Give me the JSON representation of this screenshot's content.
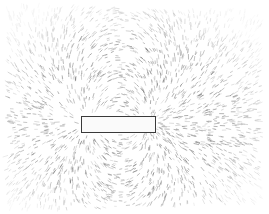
{
  "image": {
    "subject": "iron filings around a bar magnet",
    "width": 269,
    "height": 214,
    "background": "#ffffff",
    "filing_color": "#6b6b6b"
  },
  "magnet": {
    "x": 81,
    "y": 116,
    "width": 75,
    "height": 17,
    "border_color": "#3a3a3a"
  },
  "field": {
    "center_x": 118,
    "center_y": 124,
    "pole_separation": 60,
    "filing_count": 2600,
    "filing_length": 4,
    "region": {
      "x": 8,
      "y": 8,
      "width": 255,
      "height": 200
    }
  }
}
